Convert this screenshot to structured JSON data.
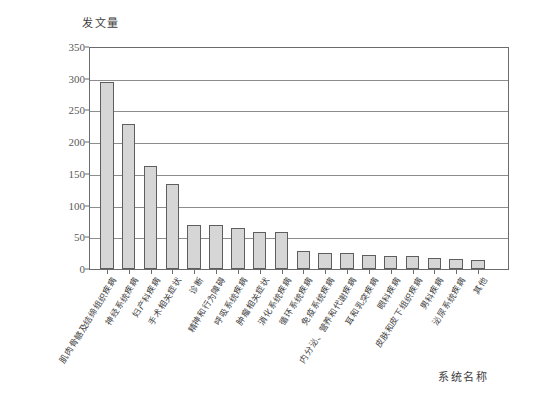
{
  "chart_data": {
    "type": "bar",
    "title": "",
    "subtitle": "",
    "xlabel": "系统名称",
    "ylabel": "发文量",
    "ylim": [
      0,
      350
    ],
    "yticks": [
      0,
      50,
      100,
      150,
      200,
      250,
      300,
      350
    ],
    "ytick_labels": [
      "0",
      "50",
      "100",
      "150",
      "200",
      "250",
      "300",
      "350"
    ],
    "grid": "horizontal",
    "legend": "none",
    "bar_fill_color": "#d6d6d6",
    "bar_edge_color": "#5e5e5e",
    "axis_color": "#6b6b6b",
    "categories": [
      "肌肉骨骼及结缔组织疾病",
      "神经系统疾病",
      "妇产科疾病",
      "手术相关症状",
      "诊断",
      "精神和行为障碍",
      "呼吸系统疾病",
      "肿瘤相关症状",
      "消化系统疾病",
      "循环系统疾病",
      "免疫系统疾病",
      "内分泌、营养和代谢疾病",
      "耳和乳突疾病",
      "眼科疾病",
      "皮肤和皮下组织疾病",
      "男科疾病",
      "泌尿系统疾病",
      "其他"
    ],
    "values": [
      295,
      228,
      163,
      134,
      70,
      69,
      65,
      59,
      58,
      29,
      26,
      25,
      22,
      21,
      20,
      17,
      16,
      15
    ]
  }
}
